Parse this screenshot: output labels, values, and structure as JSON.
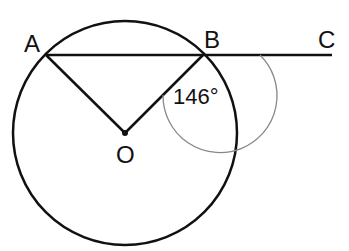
{
  "diagram": {
    "type": "circle-geometry",
    "colors": {
      "stroke": "#111111",
      "angle_arc": "#888888",
      "background": "#ffffff"
    },
    "circle": {
      "center_label": "O",
      "cx": 125,
      "cy": 133,
      "r": 112
    },
    "points": {
      "A": {
        "label": "A",
        "x": 46,
        "y": 55
      },
      "B": {
        "label": "B",
        "x": 203,
        "y": 55
      },
      "C": {
        "label": "C",
        "x": 332,
        "y": 55
      },
      "O": {
        "label": "O",
        "x": 125,
        "y": 133
      }
    },
    "segments": [
      "AB",
      "BC",
      "AO",
      "BO"
    ],
    "angle": {
      "vertex": "B",
      "between": [
        "C",
        "O"
      ],
      "label": "146°"
    }
  }
}
